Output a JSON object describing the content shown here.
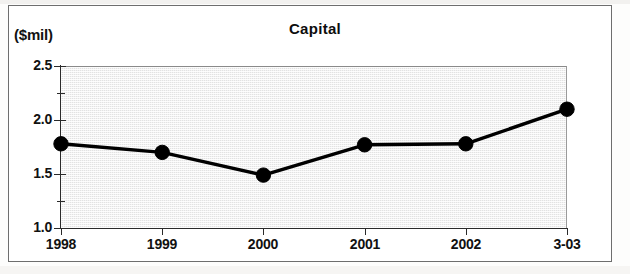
{
  "figure": {
    "unit_label": "($mil)",
    "title": "Capital"
  },
  "axis": {
    "y_major_labels": [
      "2.5",
      "2.0",
      "1.5",
      "1.0"
    ],
    "x_labels": [
      "1998",
      "1999",
      "2000",
      "2001",
      "2002",
      "3-03"
    ]
  },
  "colors": {
    "line": "#000000",
    "marker": "#000000",
    "plot_background": "#e2e2e2",
    "frame": "#6e6e6e",
    "text": "#111111"
  },
  "chart_data": {
    "type": "line",
    "title": "Capital",
    "xlabel": "",
    "ylabel": "($mil)",
    "categories": [
      "1998",
      "1999",
      "2000",
      "2001",
      "2002",
      "3-03"
    ],
    "values": [
      1.78,
      1.7,
      1.49,
      1.77,
      1.78,
      2.1
    ],
    "series": [
      {
        "name": "Capital",
        "values": [
          1.78,
          1.7,
          1.49,
          1.77,
          1.78,
          2.1
        ]
      }
    ],
    "ylim": [
      1.0,
      2.5
    ],
    "y_ticks": [
      1.0,
      1.5,
      2.0,
      2.5
    ],
    "y_minor_ticks": [
      1.25,
      1.75,
      2.25
    ],
    "grid": false,
    "legend": "none",
    "markers": "filled-circle"
  }
}
